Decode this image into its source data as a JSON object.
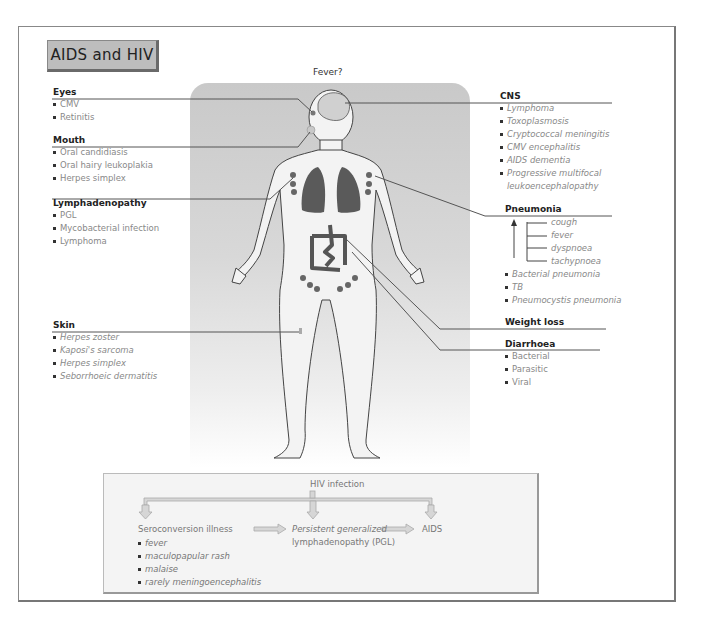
{
  "title": "AIDS and HIV",
  "center_label": "Fever?",
  "left_sections": [
    {
      "heading": "Eyes",
      "items": [
        "CMV",
        "Retinitis"
      ]
    },
    {
      "heading": "Mouth",
      "items": [
        "Oral candidiasis",
        "Oral hairy leukoplakia",
        "Herpes simplex"
      ]
    },
    {
      "heading": "Lymphadenopathy",
      "items": [
        "PGL",
        "Mycobacterial infection",
        "Lymphoma"
      ]
    },
    {
      "heading": "Skin",
      "items": [
        "Herpes zoster",
        "Kaposi's sarcoma",
        "Herpes simplex",
        "Seborrhoeic dermatitis"
      ]
    }
  ],
  "right_sections": {
    "cns": {
      "heading": "CNS",
      "items": [
        "Lymphoma",
        "Toxoplasmosis",
        "Cryptococcal meningitis",
        "CMV encephalitis",
        "AIDS dementia",
        "Progressive multifocal leukoencephalopathy"
      ]
    },
    "pneumonia": {
      "heading": "Pneumonia",
      "symptoms": [
        "cough",
        "fever",
        "dyspnoea",
        "tachypnoea"
      ],
      "items": [
        "Bacterial pneumonia",
        "TB",
        "Pneumocystis pneumonia"
      ]
    },
    "weight_loss": {
      "heading": "Weight loss"
    },
    "diarrhoea": {
      "heading": "Diarrhoea",
      "items": [
        "Bacterial",
        "Parasitic",
        "Viral"
      ]
    }
  },
  "flow": {
    "root": "HIV infection",
    "stage1": {
      "label": "Seroconversion illness",
      "items": [
        "fever",
        "maculopapular rash",
        "malaise",
        "rarely meningoencephalitis"
      ]
    },
    "stage2": {
      "line1": "Persistent generalized",
      "line2": "lymphadenopathy (PGL)"
    },
    "stage3": {
      "label": "AIDS"
    }
  },
  "colors": {
    "panel_top": "#c9c9c9",
    "organ": "#5a5a5a",
    "line": "#555555",
    "title_bg": "#bdbdbd"
  }
}
